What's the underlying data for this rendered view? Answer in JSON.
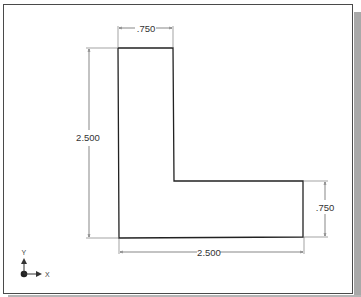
{
  "drawing": {
    "type": "2D sketch",
    "shape": "L-shaped profile",
    "colors": {
      "outline": "#222222",
      "dimension": "#555555",
      "text": "#333333",
      "frame": "#4a4a4a",
      "shadow": "#a9a9a9"
    },
    "dimensions": {
      "top_width": ".750",
      "left_height": "2.500",
      "right_height": ".750",
      "bottom_width": "2.500"
    },
    "axis_triad": {
      "x_label": "X",
      "y_label": "Y"
    }
  }
}
